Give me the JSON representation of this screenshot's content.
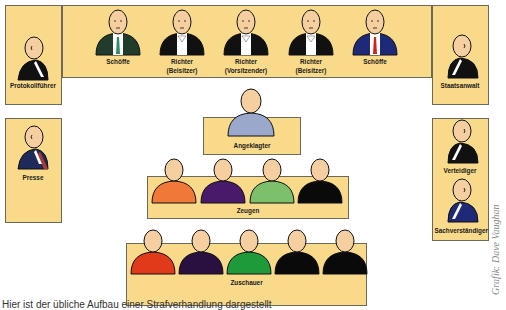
{
  "diagram": {
    "colors": {
      "panel_fill": "#f9d98a",
      "panel_border": "#6b6a5a",
      "skin": "#f5cfa0"
    },
    "bench": {
      "members": [
        {
          "label_line1": "Schöffe",
          "label_line2": "",
          "suit": "#1f3d2a",
          "tie": "#2e8b6a"
        },
        {
          "label_line1": "Richter",
          "label_line2": "(Beisitzer)",
          "suit": "#111111",
          "tie": "#ffffff"
        },
        {
          "label_line1": "Richter",
          "label_line2": "(Vorsitzender)",
          "suit": "#111111",
          "tie": "#ffffff"
        },
        {
          "label_line1": "Richter",
          "label_line2": "(Beisitzer)",
          "suit": "#111111",
          "tie": "#ffffff"
        },
        {
          "label_line1": "Schöffe",
          "label_line2": "",
          "suit": "#1e2a78",
          "tie": "#d42020"
        }
      ]
    },
    "protokollfuehrer": {
      "label": "Protokollführer",
      "suit": "#111111"
    },
    "staatsanwalt": {
      "label": "Staatsanwalt",
      "suit": "#111111"
    },
    "presse": {
      "label": "Presse",
      "suit": "#1e2a5a",
      "accent": "#b03a2e"
    },
    "angeklagter": {
      "label": "Angeklagter",
      "body": "#9aa8cc"
    },
    "verteidiger": {
      "label": "Verteidiger",
      "suit": "#111111"
    },
    "sachverstaendiger": {
      "label": "Sachverständiger",
      "suit": "#1e2a78"
    },
    "zeugen": {
      "label": "Zeugen",
      "people": [
        {
          "body": "#f07838"
        },
        {
          "body": "#4a1a6a"
        },
        {
          "body": "#7cc06a"
        },
        {
          "body": "#0a0a0a"
        }
      ]
    },
    "zuschauer": {
      "label": "Zuschauer",
      "people": [
        {
          "body": "#e03a1a"
        },
        {
          "body": "#2a1040"
        },
        {
          "body": "#1f9a3a"
        },
        {
          "body": "#0a0a0a"
        },
        {
          "body": "#0a0a0a"
        }
      ]
    },
    "caption": "Hier ist der übliche Aufbau einer Strafverhandlung dargestellt",
    "credit": "Grafik: Dave Vaughan"
  }
}
